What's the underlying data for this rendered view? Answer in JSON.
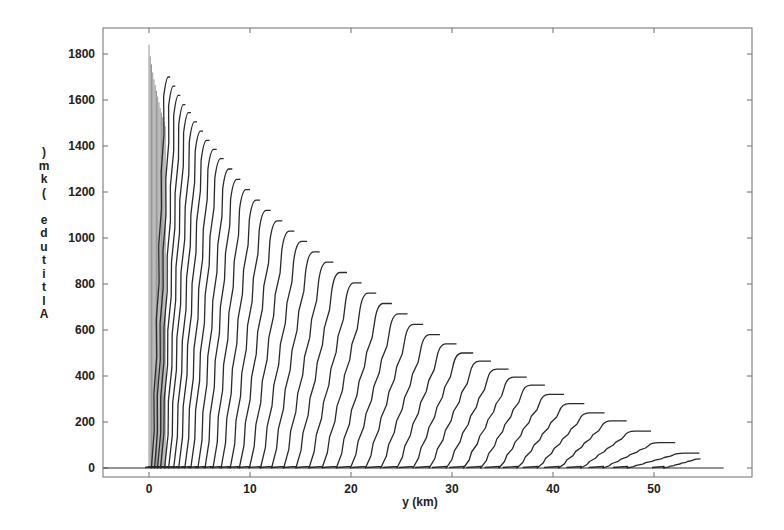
{
  "chart_data": {
    "type": "line",
    "title": "",
    "xlabel": "y (km)",
    "ylabel": "Altitude (km)",
    "ylabel_rendered_chars": [
      ")",
      "m",
      "k",
      "(",
      " ",
      "e",
      "d",
      "u",
      "t",
      "i",
      "t",
      "l",
      "A"
    ],
    "xlim": [
      -4.5,
      59.5
    ],
    "ylim": [
      -40,
      1900
    ],
    "x_ticks": [
      0,
      10,
      20,
      30,
      40,
      50
    ],
    "x_tick_labels": [
      "0",
      "10",
      "20",
      "30",
      "40",
      "50"
    ],
    "y_ticks": [
      0,
      200,
      400,
      600,
      800,
      1000,
      1200,
      1400,
      1600,
      1800
    ],
    "y_tick_labels": [
      "0",
      "200",
      "400",
      "600",
      "800",
      "1000",
      "1200",
      "1400",
      "1600",
      "1800"
    ],
    "grid": false,
    "legend": null,
    "baseline": {
      "y": 0,
      "x_start": -4.5,
      "x_end": 56.9
    },
    "dense_band": {
      "description": "closely spaced near-vertical lines near y=0 km",
      "x_start": 0.0,
      "x_end": 1.6,
      "count": 14,
      "top_heights": [
        1840,
        1790,
        1755,
        1720,
        1690,
        1665,
        1640,
        1615,
        1590,
        1565,
        1545,
        1525,
        1505,
        1485
      ]
    },
    "profiles": {
      "description": "each profile rises from base_x at altitude 0 to a peak at top_x with a short flat cap of length cap_km",
      "columns": [
        "base_x_km",
        "top_x_km",
        "peak_m",
        "cap_km"
      ],
      "values": [
        [
          0.3,
          1.9,
          1700,
          0.2
        ],
        [
          0.6,
          2.4,
          1660,
          0.2
        ],
        [
          0.9,
          2.9,
          1620,
          0.2
        ],
        [
          1.2,
          3.4,
          1580,
          0.2
        ],
        [
          1.6,
          3.9,
          1545,
          0.25
        ],
        [
          2.0,
          4.5,
          1505,
          0.25
        ],
        [
          2.5,
          5.1,
          1465,
          0.25
        ],
        [
          3.0,
          5.7,
          1425,
          0.3
        ],
        [
          3.6,
          6.4,
          1385,
          0.3
        ],
        [
          4.2,
          7.1,
          1345,
          0.3
        ],
        [
          4.9,
          7.9,
          1300,
          0.35
        ],
        [
          5.6,
          8.7,
          1255,
          0.35
        ],
        [
          6.4,
          9.6,
          1210,
          0.4
        ],
        [
          7.2,
          10.6,
          1165,
          0.4
        ],
        [
          8.1,
          11.6,
          1120,
          0.45
        ],
        [
          9.0,
          12.7,
          1075,
          0.5
        ],
        [
          10.0,
          13.9,
          1030,
          0.5
        ],
        [
          11.1,
          15.1,
          985,
          0.55
        ],
        [
          12.2,
          16.3,
          940,
          0.6
        ],
        [
          13.4,
          17.6,
          895,
          0.65
        ],
        [
          14.6,
          18.9,
          850,
          0.7
        ],
        [
          15.9,
          20.3,
          805,
          0.75
        ],
        [
          17.2,
          21.7,
          760,
          0.8
        ],
        [
          18.6,
          23.2,
          715,
          0.85
        ],
        [
          20.0,
          24.7,
          670,
          0.9
        ],
        [
          21.5,
          26.2,
          625,
          0.95
        ],
        [
          23.0,
          27.8,
          580,
          1.0
        ],
        [
          24.6,
          29.4,
          540,
          1.05
        ],
        [
          26.2,
          31.0,
          500,
          1.1
        ],
        [
          27.8,
          32.7,
          465,
          1.15
        ],
        [
          29.5,
          34.4,
          430,
          1.2
        ],
        [
          31.2,
          36.1,
          395,
          1.3
        ],
        [
          32.9,
          37.8,
          360,
          1.4
        ],
        [
          34.7,
          39.6,
          320,
          1.5
        ],
        [
          36.5,
          41.6,
          280,
          1.5
        ],
        [
          38.5,
          43.6,
          240,
          1.5
        ],
        [
          40.6,
          45.8,
          205,
          1.5
        ],
        [
          42.8,
          48.1,
          160,
          1.6
        ],
        [
          45.0,
          50.5,
          110,
          1.6
        ],
        [
          47.4,
          53.0,
          65,
          1.5
        ],
        [
          51.0,
          54.6,
          40,
          0.0
        ]
      ]
    },
    "annotations": []
  },
  "colors": {
    "background": "#ffffff",
    "frame": "#6f6f6f",
    "curves": "#2a2a2a",
    "dense_band": "#8a8a8a",
    "text": "#222222"
  }
}
